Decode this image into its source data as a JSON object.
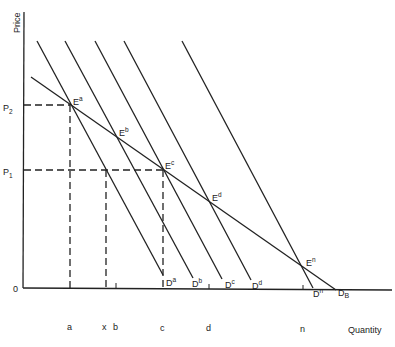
{
  "axes": {
    "y_label": "Price",
    "x_label": "Quantity",
    "origin": "0"
  },
  "price_levels": [
    {
      "label": "P",
      "sub": "2"
    },
    {
      "label": "P",
      "sub": "1"
    }
  ],
  "quantity_ticks": [
    "a",
    "x",
    "b",
    "c",
    "d",
    "n"
  ],
  "equilibria": [
    {
      "label": "E",
      "sup": "a"
    },
    {
      "label": "E",
      "sup": "b"
    },
    {
      "label": "E",
      "sup": "c"
    },
    {
      "label": "E",
      "sup": "d"
    },
    {
      "label": "E",
      "sup": "n"
    }
  ],
  "demand_curves": [
    {
      "label": "D",
      "sup": "a"
    },
    {
      "label": "D",
      "sup": "b"
    },
    {
      "label": "D",
      "sup": "c"
    },
    {
      "label": "D",
      "sup": "d"
    },
    {
      "label": "D",
      "sup": "n"
    }
  ],
  "market_curve": {
    "label": "D",
    "sub": "B"
  }
}
